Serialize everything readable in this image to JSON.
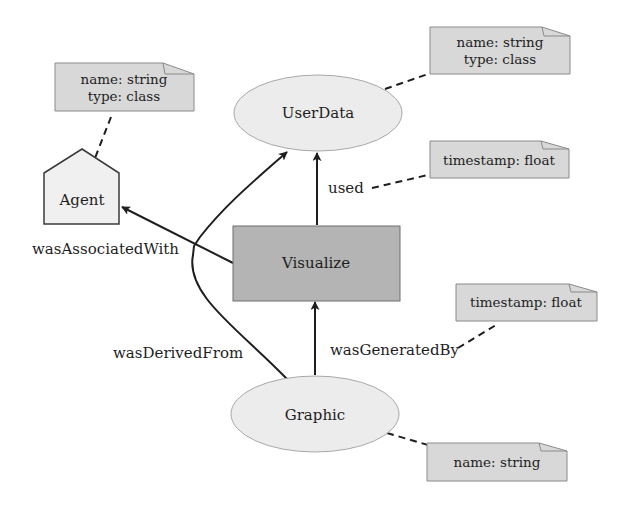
{
  "diagram": {
    "type": "provenance-graph",
    "colors": {
      "entity_fill": "#ececec",
      "entity_stroke": "#a8a8a8",
      "activity_fill": "#b4b4b4",
      "activity_stroke": "#6e6e6e",
      "agent_fill": "#f0f0f0",
      "agent_stroke": "#3a3a3a",
      "note_fill": "#d8d8d8",
      "note_stroke": "#8a8a8a",
      "edge_color": "#1e1e1e"
    },
    "nodes": {
      "agent": {
        "label": "Agent",
        "shape": "house"
      },
      "userdata": {
        "label": "UserData",
        "shape": "ellipse"
      },
      "visualize": {
        "label": "Visualize",
        "shape": "rectangle"
      },
      "graphic": {
        "label": "Graphic",
        "shape": "ellipse"
      }
    },
    "edges": {
      "used": {
        "label": "used",
        "from": "Visualize",
        "to": "UserData"
      },
      "was_associated_with": {
        "label": "wasAssociatedWith",
        "from": "Visualize",
        "to": "Agent"
      },
      "was_derived_from": {
        "label": "wasDerivedFrom",
        "from": "Graphic",
        "to": "UserData"
      },
      "was_generated_by": {
        "label": "wasGeneratedBy",
        "from": "Graphic",
        "to": "Visualize"
      }
    },
    "notes": {
      "agent_note": {
        "lines": [
          "name: string",
          "type: class"
        ]
      },
      "userdata_note": {
        "lines": [
          "name: string",
          "type: class"
        ]
      },
      "used_note": {
        "lines": [
          "timestamp: float"
        ]
      },
      "generated_note": {
        "lines": [
          "timestamp: float"
        ]
      },
      "graphic_note": {
        "lines": [
          "name: string"
        ]
      }
    }
  }
}
